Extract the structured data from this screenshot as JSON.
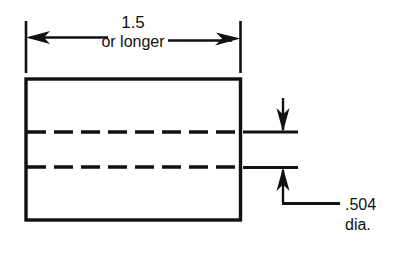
{
  "drawing": {
    "title": "Bar stock front view with hidden hole lines",
    "background_color": "#ffffff",
    "line_color": "#111111",
    "width_dimension": {
      "value": "1.5",
      "qualifier": "or longer",
      "arrow_style": "double-arrow",
      "position": "above-part"
    },
    "diameter_callout": {
      "value": ".504",
      "unit_label": "dia.",
      "leader_style": "jogged-leader-with-arrows",
      "position": "right-of-part"
    },
    "part": {
      "outline_shape": "rectangle",
      "hidden_lines": [
        {
          "name": "hidden-line-top",
          "style": "dashed"
        },
        {
          "name": "hidden-line-bottom",
          "style": "dashed"
        }
      ]
    }
  }
}
